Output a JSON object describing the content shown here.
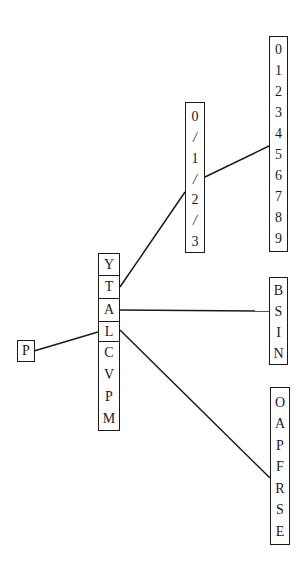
{
  "diagram": {
    "type": "tree",
    "nodes": {
      "root": {
        "id": "root",
        "labels": [
          "P"
        ],
        "box": {
          "x": 17,
          "y": 340,
          "w": 18,
          "h": 22
        }
      },
      "center": {
        "id": "center",
        "labels": [
          "Y",
          "T",
          "A",
          "L",
          "C",
          "V",
          "P",
          "M"
        ],
        "separated_cells": [
          "Y",
          "T",
          "A",
          "L"
        ],
        "box": {
          "x": 98,
          "y": 253,
          "w": 22,
          "h": 178
        }
      },
      "hour": {
        "id": "hour",
        "labels": [
          "0",
          "/",
          "1",
          "/",
          "2",
          "/",
          "3"
        ],
        "box": {
          "x": 185,
          "y": 102,
          "w": 20,
          "h": 151
        }
      },
      "digits": {
        "id": "digits",
        "labels": [
          "0",
          "1",
          "2",
          "3",
          "4",
          "5",
          "6",
          "7",
          "8",
          "9"
        ],
        "box": {
          "x": 269,
          "y": 36,
          "w": 19,
          "h": 216
        }
      },
      "bsin": {
        "id": "bsin",
        "labels": [
          "B",
          "S",
          "I",
          "N"
        ],
        "box": {
          "x": 269,
          "y": 277,
          "w": 19,
          "h": 88
        }
      },
      "oapfrse": {
        "id": "oapfrse",
        "labels": [
          "O",
          "A",
          "P",
          "F",
          "R",
          "S",
          "E"
        ],
        "box": {
          "x": 270,
          "y": 387,
          "w": 20,
          "h": 158
        }
      }
    },
    "edges": [
      {
        "from": "root",
        "from_label": "P",
        "to": "center",
        "to_label": "L",
        "x1": 34,
        "y1": 351,
        "x2": 98,
        "y2": 332
      },
      {
        "from": "center",
        "from_label": "T",
        "to": "hour",
        "to_label": "2",
        "x1": 120,
        "y1": 287,
        "x2": 185,
        "y2": 192
      },
      {
        "from": "hour",
        "from_label": "/",
        "to": "digits",
        "to_label": "5",
        "x1": 205,
        "y1": 177,
        "x2": 269,
        "y2": 146
      },
      {
        "from": "center",
        "from_label": "A",
        "to": "bsin",
        "to_label": "S",
        "x1": 120,
        "y1": 310,
        "x2": 269,
        "y2": 311
      },
      {
        "from": "center",
        "from_label": "L",
        "to": "oapfrse",
        "to_label": "R",
        "x1": 120,
        "y1": 330,
        "x2": 270,
        "y2": 478
      }
    ]
  }
}
